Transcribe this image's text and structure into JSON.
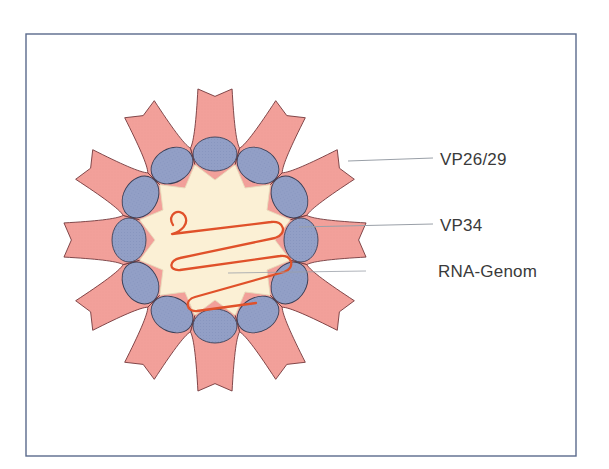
{
  "figure": {
    "frame": {
      "x": 26,
      "y": 34,
      "width": 550,
      "height": 422,
      "stroke": "#5a6a8c",
      "stroke_width": 1.4
    },
    "background_color": "#ffffff"
  },
  "virion": {
    "center_x": 215,
    "center_y": 240,
    "spike_count": 12,
    "spike_outer_radius": 152,
    "spike_inner_radius": 95,
    "capsomer_count": 12,
    "capsomer_ring_radius": 86,
    "capsomer_rx": 22,
    "capsomer_ry": 17,
    "core_outer_radius": 78,
    "core_inner_radius": 60,
    "colors": {
      "spike_fill": "#f2a09a",
      "spike_outline": "#6b2f33",
      "capsomer_fill": "#929fc6",
      "capsomer_outline": "#3a3f56",
      "core_fill": "#fbf0d5",
      "core_outline": "#e8dcbc",
      "rna_stroke": "#e0512a",
      "leader_line": "#9aa0a8"
    }
  },
  "rna": {
    "name": "RNA genome strand",
    "stroke_width": 2.3,
    "path": "M 173 225 C 166 214, 180 207, 185 216 C 189 224, 182 231, 172 234 L 271 222 C 284 220, 288 234, 275 238 L 180 258 C 169 260, 168 271, 180 270 L 280 256 C 292 254, 296 268, 284 272 L 195 297 C 184 300, 186 312, 197 311 L 256 303"
  },
  "labels": [
    {
      "id": "vp2629",
      "text": "VP26/29",
      "text_x": 440,
      "text_y": 151,
      "leader": {
        "x1": 348,
        "y1": 161,
        "x2": 433,
        "y2": 158
      }
    },
    {
      "id": "vp34",
      "text": "VP34",
      "text_x": 440,
      "text_y": 217,
      "leader": {
        "x1": 299,
        "y1": 227,
        "x2": 433,
        "y2": 224
      }
    },
    {
      "id": "rna_genom",
      "text": "RNA-Genom",
      "text_x": 438,
      "text_y": 263,
      "leader": {
        "x1": 228,
        "y1": 273,
        "x2": 366,
        "y2": 271
      }
    }
  ]
}
